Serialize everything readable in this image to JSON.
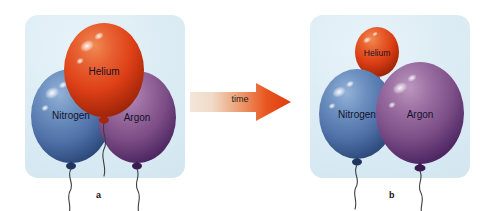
{
  "figure": {
    "background_color": "#ffffff"
  },
  "panels": [
    {
      "id": "a",
      "caption": "a",
      "background_color": "#dcecf4",
      "balloons": [
        {
          "gas": "Helium",
          "label": "Helium",
          "color": "#e14b20",
          "highlight_color": "#ffffff",
          "size": "large"
        },
        {
          "gas": "Nitrogen",
          "label": "Nitrogen",
          "color": "#5b7fb5",
          "highlight_color": "#ffffff",
          "size": "large"
        },
        {
          "gas": "Argon",
          "label": "Argon",
          "color": "#8e5e94",
          "highlight_color": "#ffffff",
          "size": "large"
        }
      ]
    },
    {
      "id": "b",
      "caption": "b",
      "background_color": "#dcecf4",
      "balloons": [
        {
          "gas": "Helium",
          "label": "Helium",
          "color": "#e14b20",
          "highlight_color": "#ffffff",
          "size": "small"
        },
        {
          "gas": "Nitrogen",
          "label": "Nitrogen",
          "color": "#5b7fb5",
          "highlight_color": "#ffffff",
          "size": "large"
        },
        {
          "gas": "Argon",
          "label": "Argon",
          "color": "#8e5e94",
          "highlight_color": "#ffffff",
          "size": "large"
        }
      ]
    }
  ],
  "arrow": {
    "label": "time",
    "direction": "right",
    "gradient_start_color": "#f2e2d5",
    "gradient_end_color": "#e8441a"
  }
}
